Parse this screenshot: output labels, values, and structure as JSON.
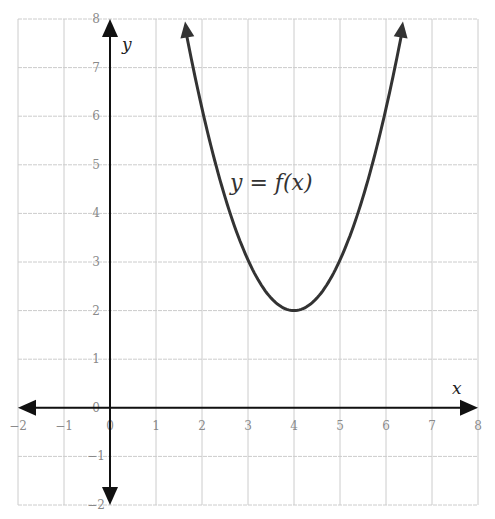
{
  "chart_data": {
    "type": "line",
    "title": "",
    "xlabel": "x",
    "ylabel": "y",
    "xlim": [
      -2,
      8
    ],
    "ylim": [
      -2,
      8
    ],
    "grid": true,
    "x_ticks": [
      "-2",
      "-1",
      "0",
      "1",
      "2",
      "3",
      "4",
      "5",
      "6",
      "7",
      "8"
    ],
    "y_ticks": [
      "-2",
      "-1",
      "0",
      "1",
      "2",
      "3",
      "4",
      "5",
      "6",
      "7",
      "8"
    ],
    "series": [
      {
        "name": "y = f(x)",
        "equation": "f(x) = (x - 4)^2 + 2",
        "vertex": [
          4,
          2
        ],
        "x": [
          1.6,
          2,
          2.5,
          3,
          3.5,
          4,
          4.5,
          5,
          5.5,
          6,
          6.4
        ],
        "values": [
          7.76,
          6,
          4.25,
          3,
          2.25,
          2,
          2.25,
          3,
          4.25,
          6,
          7.76
        ],
        "arrows_at_ends": true
      }
    ],
    "annotations": [
      {
        "text": "y = f(x)",
        "x": 3.3,
        "y": 4.9
      }
    ]
  },
  "labels": {
    "x_axis": "x",
    "y_axis": "y",
    "function": "y = f(x)"
  },
  "colors": {
    "curve": "#333333",
    "axes": "#111111",
    "grid": "#cccccc",
    "tick_text": "#8a8a8a"
  }
}
